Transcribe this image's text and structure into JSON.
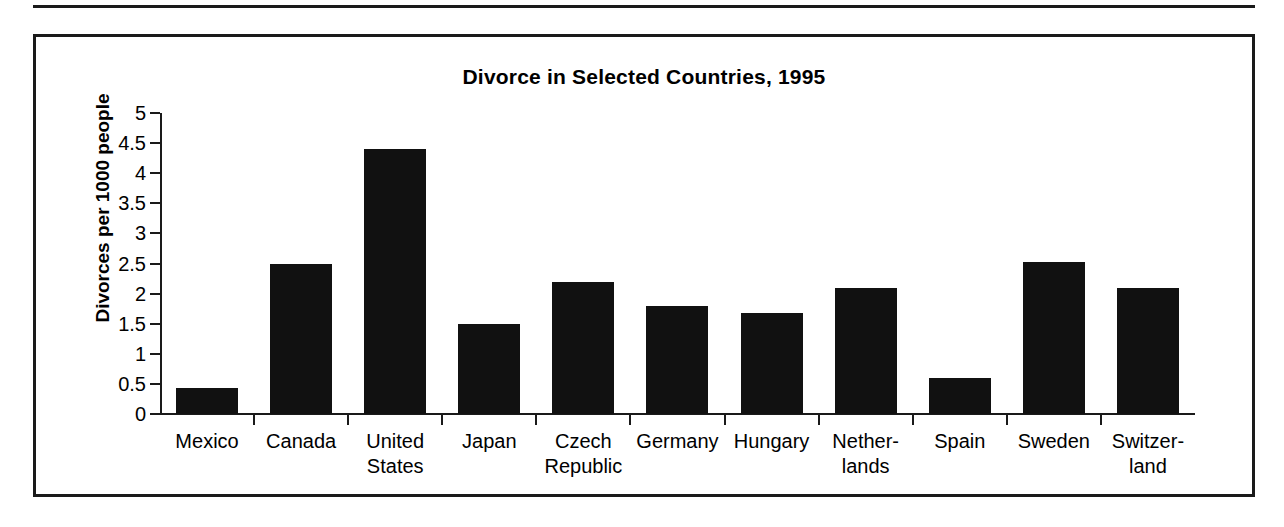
{
  "figure": {
    "title": "Divorce in Selected Countries, 1995",
    "y_axis_title": "Divorces per 1000 people"
  },
  "chart_data": {
    "type": "bar",
    "title": "Divorce in Selected Countries, 1995",
    "xlabel": "",
    "ylabel": "Divorces per 1000 people",
    "ylim": [
      0,
      5
    ],
    "yticks": [
      0,
      0.5,
      1,
      1.5,
      2,
      2.5,
      3,
      3.5,
      4,
      4.5,
      5
    ],
    "ytick_labels": [
      "0",
      "0.5",
      "1",
      "1.5",
      "2",
      "2.5",
      "3",
      "3.5",
      "4",
      "4.5",
      "5"
    ],
    "grid": false,
    "legend": null,
    "bar_color": "#111111",
    "categories": [
      "Mexico",
      "Canada",
      "United States",
      "Japan",
      "Czech Republic",
      "Germany",
      "Hungary",
      "Netherlands",
      "Spain",
      "Sweden",
      "Switzerland"
    ],
    "category_lines": [
      [
        "Mexico"
      ],
      [
        "Canada"
      ],
      [
        "United",
        "States"
      ],
      [
        "Japan"
      ],
      [
        "Czech",
        "Republic"
      ],
      [
        "Germany"
      ],
      [
        "Hungary"
      ],
      [
        "Nether-",
        "lands"
      ],
      [
        "Spain"
      ],
      [
        "Sweden"
      ],
      [
        "Switzer-",
        "land"
      ]
    ],
    "values": [
      0.43,
      2.5,
      4.4,
      1.5,
      2.2,
      1.8,
      1.67,
      2.1,
      0.6,
      2.52,
      2.1
    ]
  }
}
